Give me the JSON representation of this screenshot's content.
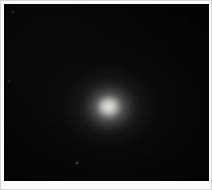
{
  "image": {
    "kind": "astronomical-exposure",
    "width": 212,
    "height": 190,
    "background_color": "#010101",
    "frame_color": "#fbfbfb",
    "frame_border_color": "#d8d8d8",
    "frame_inset_px": 4,
    "alt_text": ""
  },
  "field": {
    "sky_width": 205,
    "sky_height": 177,
    "sky_color": "#010101"
  },
  "objects": {
    "primary": {
      "name": "diffuse-nebulous-object",
      "center_x_pct": 51,
      "center_y_pct": 58,
      "core_color": "#f2f2f0",
      "halo_color": "#969696",
      "core_width_px": 22,
      "core_height_px": 20,
      "mid_width_px": 48,
      "mid_height_px": 44,
      "halo_width_px": 88,
      "halo_height_px": 78
    },
    "stars": [
      {
        "name": "faint-star-lower-left",
        "x_pct": 35.5,
        "y_pct": 90.0,
        "size_px": 2.2,
        "color": "#6e6a62",
        "opacity": 0.78
      },
      {
        "name": "faint-star-upper-left",
        "x_pct": 4.2,
        "y_pct": 4.8,
        "size_px": 2.0,
        "color": "#4a4a4a",
        "opacity": 0.55
      },
      {
        "name": "faint-star-left-mid",
        "x_pct": 2.6,
        "y_pct": 43.5,
        "size_px": 1.8,
        "color": "#3e3e3e",
        "opacity": 0.45
      },
      {
        "name": "faint-star-lower-right",
        "x_pct": 72.0,
        "y_pct": 84.0,
        "size_px": 1.6,
        "color": "#343434",
        "opacity": 0.4
      },
      {
        "name": "faint-star-upper-right",
        "x_pct": 88.0,
        "y_pct": 9.0,
        "size_px": 1.5,
        "color": "#303030",
        "opacity": 0.35
      },
      {
        "name": "faint-star-center-left",
        "x_pct": 23.0,
        "y_pct": 66.0,
        "size_px": 1.5,
        "color": "#2e2e2e",
        "opacity": 0.33
      }
    ]
  }
}
